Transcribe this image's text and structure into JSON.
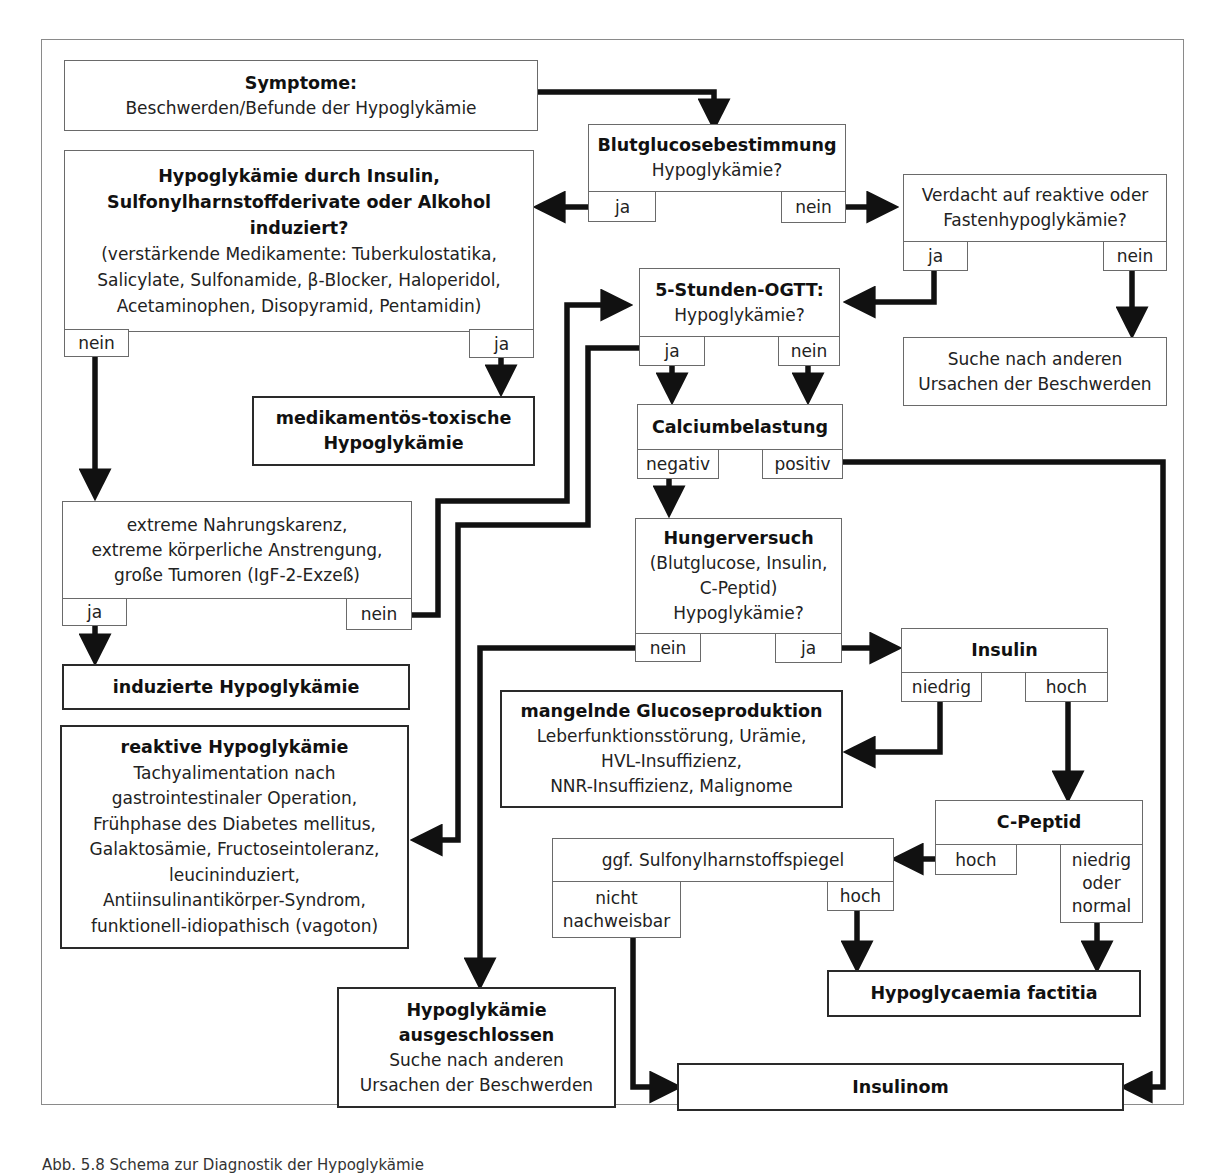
{
  "diagram": {
    "nodes": {
      "symptome": {
        "title": "Symptome:",
        "text": "Beschwerden/Befunde der Hypoglykämie"
      },
      "blutglucose": {
        "title": "Blutglucosebestimmung",
        "text": "Hypoglykämie?",
        "yes": "ja",
        "no": "nein"
      },
      "induziert": {
        "title_lines": [
          "Hypoglykämie durch Insulin,",
          "Sulfonylharnstoffderivate oder Alkohol",
          "induziert?"
        ],
        "text_lines": [
          "(verstärkende Medikamente: Tuberkulostatika,",
          "Salicylate, Sulfonamide, β-Blocker, Haloperidol,",
          "Acetaminophen, Disopyramid, Pentamidin)"
        ],
        "no": "nein",
        "yes": "ja"
      },
      "verdacht": {
        "text_lines": [
          "Verdacht auf reaktive oder",
          "Fastenhypoglykämie?"
        ],
        "yes": "ja",
        "no": "nein"
      },
      "ogtt": {
        "title": "5-Stunden-OGTT:",
        "text": "Hypoglykämie?",
        "yes": "ja",
        "no": "nein"
      },
      "suche1": {
        "text_lines": [
          "Suche nach anderen",
          "Ursachen der Beschwerden"
        ]
      },
      "medikamentoes": {
        "title_lines": [
          "medikamentös-toxische",
          "Hypoglykämie"
        ]
      },
      "calcium": {
        "title": "Calciumbelastung",
        "neg": "negativ",
        "pos": "positiv"
      },
      "extrem": {
        "text_lines": [
          "extreme Nahrungskarenz,",
          "extreme körperliche Anstrengung,",
          "große Tumoren (IgF-2-Exzeß)"
        ],
        "yes": "ja",
        "no": "nein"
      },
      "hunger": {
        "title": "Hungerversuch",
        "text_lines": [
          "(Blutglucose, Insulin,",
          "C-Peptid)",
          "Hypoglykämie?"
        ],
        "no": "nein",
        "yes": "ja"
      },
      "induzierte_hypo": {
        "title": "induzierte Hypoglykämie"
      },
      "insulin": {
        "title": "Insulin",
        "low": "niedrig",
        "high": "hoch"
      },
      "mangelnde": {
        "title": "mangelnde Glucoseproduktion",
        "text_lines": [
          "Leberfunktionsstörung, Urämie,",
          "HVL-Insuffizienz,",
          "NNR-Insuffizienz, Malignome"
        ]
      },
      "reaktive": {
        "title": "reaktive Hypoglykämie",
        "text_lines": [
          "Tachyalimentation nach",
          "gastrointestinaler Operation,",
          "Frühphase des Diabetes mellitus,",
          "Galaktosämie, Fructoseintoleranz,",
          "leucininduziert,",
          "Antiinsulinantikörper-Syndrom,",
          "funktionell-idiopathisch (vagoton)"
        ]
      },
      "cpeptid": {
        "title": "C-Peptid",
        "high": "hoch",
        "low_lines": [
          "niedrig",
          "oder",
          "normal"
        ]
      },
      "sulfonyl": {
        "text": "ggf. Sulfonylharnstoffspiegel",
        "not_lines": [
          "nicht",
          "nachweisbar"
        ],
        "high": "hoch"
      },
      "factitia": {
        "title": "Hypoglycaemia factitia"
      },
      "ausgeschlossen": {
        "title_lines": [
          "Hypoglykämie",
          "ausgeschlossen"
        ],
        "text_lines": [
          "Suche nach anderen",
          "Ursachen der Beschwerden"
        ]
      },
      "insulinom": {
        "title": "Insulinom"
      }
    },
    "caption": "Abb. 5.8 Schema zur Diagnostik der Hypoglykämie"
  }
}
